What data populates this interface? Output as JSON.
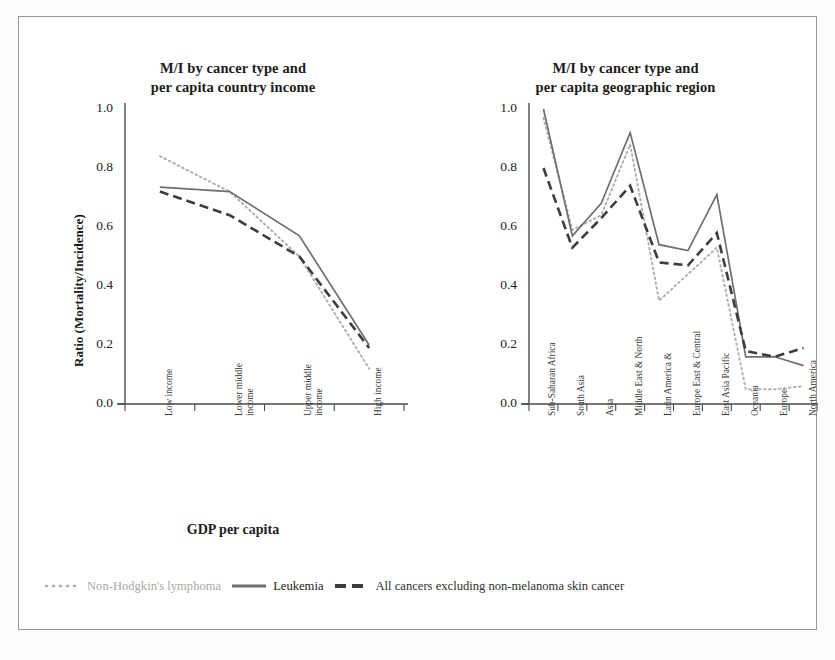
{
  "figure": {
    "background": "#ffffff",
    "border_color": "#9a9a96"
  },
  "legend": {
    "items": [
      {
        "label": "Non-Hodgkin's lymphoma",
        "style": "dotted",
        "color": "#b0b0ae"
      },
      {
        "label": "Leukemia",
        "style": "solid",
        "color": "#6f6f6d"
      },
      {
        "label": "All cancers excluding non-melanoma skin cancer",
        "style": "dashed",
        "color": "#3d3d3d"
      }
    ]
  },
  "panels": {
    "left": {
      "title_line1": "M/I by cancer type and",
      "title_line2": "per capita country income",
      "ylabel": "Ratio (Mortality/Incidence)",
      "xlabel": "GDP per capita",
      "yticks": [
        "0.0",
        "0.2",
        "0.4",
        "0.6",
        "0.8",
        "1.0"
      ]
    },
    "right": {
      "title_line1": "M/I by cancer type and",
      "title_line2": "per capita geographic region",
      "ylabel": "Ratio (Mortality/Incidence)",
      "xlabel": "",
      "yticks": [
        "0.0",
        "0.2",
        "0.4",
        "0.6",
        "0.8",
        "1.0"
      ]
    }
  },
  "chart_data": [
    {
      "id": "left",
      "type": "line",
      "title": "M/I by cancer type and per capita country income",
      "xlabel": "GDP per capita",
      "ylabel": "Ratio (Mortality/Incidence)",
      "ylim": [
        0.0,
        1.0
      ],
      "ytick_values": [
        0.0,
        0.2,
        0.4,
        0.6,
        0.8,
        1.0
      ],
      "grid": false,
      "legend_position": "below-figure",
      "categories": [
        {
          "line1": "Low income",
          "line2": ""
        },
        {
          "line1": "Lower middle",
          "line2": "income"
        },
        {
          "line1": "Upper middle",
          "line2": "income"
        },
        {
          "line1": "High income",
          "line2": ""
        }
      ],
      "series": [
        {
          "name": "Non-Hodgkin's lymphoma",
          "style": "dotted",
          "color": "#b0b0ae",
          "values": [
            0.84,
            0.72,
            0.5,
            0.12
          ]
        },
        {
          "name": "Leukemia",
          "style": "solid",
          "color": "#6f6f6d",
          "values": [
            0.735,
            0.72,
            0.57,
            0.2
          ]
        },
        {
          "name": "All cancers excluding non-melanoma skin cancer",
          "style": "dashed",
          "color": "#3d3d3d",
          "values": [
            0.72,
            0.64,
            0.5,
            0.19
          ]
        }
      ]
    },
    {
      "id": "right",
      "type": "line",
      "title": "M/I by cancer type and per capita geographic region",
      "xlabel": "",
      "ylabel": "Ratio (Mortality/Incidence)",
      "ylim": [
        0.0,
        1.0
      ],
      "ytick_values": [
        0.0,
        0.2,
        0.4,
        0.6,
        0.8,
        1.0
      ],
      "grid": false,
      "legend_position": "below-figure",
      "categories": [
        {
          "line1": "Sub-Saharan Africa",
          "line2": ""
        },
        {
          "line1": "South Asia",
          "line2": ""
        },
        {
          "line1": "Asia",
          "line2": ""
        },
        {
          "line1": "Middle East & North",
          "line2": ""
        },
        {
          "line1": "Latin America &",
          "line2": ""
        },
        {
          "line1": "Europe East & Central",
          "line2": ""
        },
        {
          "line1": "East Asia Pacific",
          "line2": ""
        },
        {
          "line1": "Oceania",
          "line2": ""
        },
        {
          "line1": "Europe",
          "line2": ""
        },
        {
          "line1": "North America",
          "line2": ""
        }
      ],
      "series": [
        {
          "name": "Non-Hodgkin's lymphoma",
          "style": "dotted",
          "color": "#b0b0ae",
          "values": [
            0.97,
            0.59,
            0.64,
            0.88,
            0.35,
            0.44,
            0.53,
            0.05,
            0.05,
            0.06
          ]
        },
        {
          "name": "Leukemia",
          "style": "solid",
          "color": "#6f6f6d",
          "values": [
            1.0,
            0.57,
            0.68,
            0.92,
            0.54,
            0.52,
            0.71,
            0.16,
            0.16,
            0.13
          ]
        },
        {
          "name": "All cancers excluding non-melanoma skin cancer",
          "style": "dashed",
          "color": "#3d3d3d",
          "values": [
            0.8,
            0.53,
            0.63,
            0.74,
            0.48,
            0.47,
            0.58,
            0.18,
            0.16,
            0.19
          ]
        }
      ]
    }
  ]
}
